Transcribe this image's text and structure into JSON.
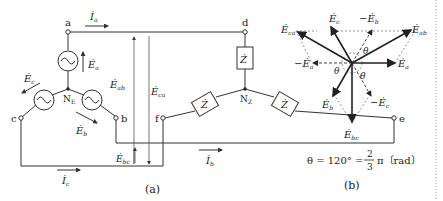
{
  "diagram_a": {
    "caption": "(a)",
    "nodes": {
      "a": "a",
      "b": "b",
      "c": "c",
      "d": "d",
      "e": "e",
      "f": "f",
      "ne": "N",
      "ne_sub": "E",
      "nz": "N",
      "nz_sub": "Z"
    },
    "currents": {
      "ia": "İ",
      "ia_sub": "a",
      "ib": "İ",
      "ib_sub": "b",
      "ic": "İ",
      "ic_sub": "c"
    },
    "emfs": {
      "ea": "Ė",
      "ea_sub": "a",
      "eb": "Ė",
      "eb_sub": "b",
      "ec": "Ė",
      "ec_sub": "c"
    },
    "line_voltages": {
      "eab": "Ė",
      "eab_sub": "ab",
      "eca": "Ė",
      "eca_sub": "ca",
      "ebc": "Ė",
      "ebc_sub": "bc"
    },
    "impedance": "Ż"
  },
  "diagram_b": {
    "caption": "(b)",
    "vectors": {
      "ea": "Ė",
      "ea_sub": "a",
      "eb": "Ė",
      "eb_sub": "b",
      "ec": "Ė",
      "ec_sub": "c",
      "neg_ea": "−Ė",
      "neg_ea_sub": "a",
      "neg_eb": "−Ė",
      "neg_eb_sub": "b",
      "neg_ec": "−Ė",
      "neg_ec_sub": "c",
      "eab": "Ė",
      "eab_sub": "ab",
      "ebc": "Ė",
      "ebc_sub": "bc",
      "eca": "Ė",
      "eca_sub": "ca"
    },
    "angle_symbol": "θ",
    "formula_lhs": "θ = 120° = ",
    "formula_num": "2",
    "formula_den": "3",
    "formula_rhs": "π〔rad〕"
  }
}
